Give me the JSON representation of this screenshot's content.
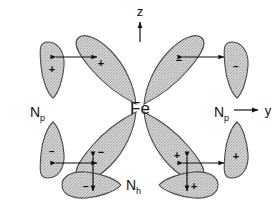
{
  "figure": {
    "center_atom": "Fe",
    "colors": {
      "lobe_fill": "#c9c9c9",
      "lobe_stroke": "#4a4a4a",
      "text": "#111111",
      "background": "#ffffff"
    }
  },
  "axes": {
    "vertical": {
      "label": "z",
      "direction": "up"
    },
    "horizontal": {
      "label": "y",
      "direction": "right"
    }
  },
  "labels": {
    "center": "Fe",
    "left_pyrrole": "N",
    "left_pyrrole_sub": "p",
    "right_pyrrole": "N",
    "right_pyrrole_sub": "p",
    "histidine": "N",
    "histidine_sub": "h"
  },
  "orbitals": {
    "metal_lobes": [
      {
        "name": "fe-lobe-upper-left",
        "sign": "+",
        "quadrant": "upper-left"
      },
      {
        "name": "fe-lobe-upper-right",
        "sign": "−",
        "quadrant": "upper-right"
      },
      {
        "name": "fe-lobe-lower-left",
        "sign": "−",
        "quadrant": "lower-left"
      },
      {
        "name": "fe-lobe-lower-right",
        "sign": "+",
        "quadrant": "lower-right"
      }
    ],
    "ligand_lobes": [
      {
        "name": "np-left-upper",
        "sign": "+",
        "ligand": "Np",
        "position": "left-upper"
      },
      {
        "name": "np-left-lower",
        "sign": "−",
        "ligand": "Np",
        "position": "left-lower"
      },
      {
        "name": "np-right-upper",
        "sign": "−",
        "ligand": "Np",
        "position": "right-upper"
      },
      {
        "name": "np-right-lower",
        "sign": "+",
        "ligand": "Np",
        "position": "right-lower"
      },
      {
        "name": "nh-bottom-left",
        "sign": "−",
        "ligand": "Nh",
        "position": "bottom-left"
      },
      {
        "name": "nh-bottom-right",
        "sign": "+",
        "ligand": "Nh",
        "position": "bottom-right"
      }
    ]
  },
  "interactions": [
    {
      "name": "overlap-arrow-upper-left",
      "orientation": "horizontal",
      "double_headed": true
    },
    {
      "name": "overlap-arrow-upper-right",
      "orientation": "horizontal",
      "double_headed": true
    },
    {
      "name": "overlap-arrow-lower-left",
      "orientation": "horizontal",
      "double_headed": true
    },
    {
      "name": "overlap-arrow-lower-right",
      "orientation": "horizontal",
      "double_headed": true
    },
    {
      "name": "overlap-arrow-bottom-left",
      "orientation": "vertical",
      "double_headed": true
    },
    {
      "name": "overlap-arrow-bottom-right",
      "orientation": "vertical",
      "double_headed": true
    }
  ]
}
